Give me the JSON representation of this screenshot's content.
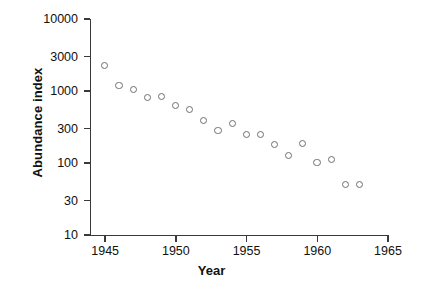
{
  "chart_data": {
    "type": "scatter",
    "title": "",
    "xlabel": "Year",
    "ylabel": "Abundance index",
    "yscale": "log",
    "xlim": [
      1944,
      1965
    ],
    "ylim": [
      10,
      10000
    ],
    "grid": false,
    "legend": null,
    "x_ticks": [
      "1945",
      "1950",
      "1955",
      "1960",
      "1965"
    ],
    "x_tick_values": [
      1945,
      1950,
      1955,
      1960,
      1965
    ],
    "y_ticks": [
      "10000",
      "3000",
      "1000",
      "300",
      "100",
      "30",
      "10"
    ],
    "y_tick_values": [
      10000,
      3000,
      1000,
      300,
      100,
      30,
      10
    ],
    "marker": "open-circle",
    "marker_color": "#6e6e74",
    "x": [
      1945,
      1946,
      1947,
      1948,
      1949,
      1950,
      1951,
      1952,
      1953,
      1954,
      1955,
      1956,
      1957,
      1958,
      1959,
      1960,
      1961,
      1962,
      1963
    ],
    "values": [
      2250,
      1180,
      1040,
      800,
      830,
      630,
      550,
      390,
      280,
      355,
      245,
      245,
      180,
      125,
      185,
      100,
      110,
      50,
      50
    ],
    "points": [
      {
        "year": 1945,
        "abundance": 2250
      },
      {
        "year": 1946,
        "abundance": 1180
      },
      {
        "year": 1947,
        "abundance": 1040
      },
      {
        "year": 1948,
        "abundance": 800
      },
      {
        "year": 1949,
        "abundance": 830
      },
      {
        "year": 1950,
        "abundance": 630
      },
      {
        "year": 1951,
        "abundance": 550
      },
      {
        "year": 1952,
        "abundance": 390
      },
      {
        "year": 1953,
        "abundance": 280
      },
      {
        "year": 1954,
        "abundance": 355
      },
      {
        "year": 1955,
        "abundance": 245
      },
      {
        "year": 1956,
        "abundance": 245
      },
      {
        "year": 1957,
        "abundance": 180
      },
      {
        "year": 1958,
        "abundance": 125
      },
      {
        "year": 1959,
        "abundance": 185
      },
      {
        "year": 1960,
        "abundance": 100
      },
      {
        "year": 1961,
        "abundance": 110
      },
      {
        "year": 1962,
        "abundance": 50
      },
      {
        "year": 1963,
        "abundance": 50
      }
    ]
  },
  "axes": {
    "y_title": "Abundance index",
    "x_title": "Year"
  },
  "colors": {
    "background": "#ffffff",
    "axis": "#3a3a3a",
    "marker_stroke": "#6e6e74",
    "text": "#111111"
  }
}
